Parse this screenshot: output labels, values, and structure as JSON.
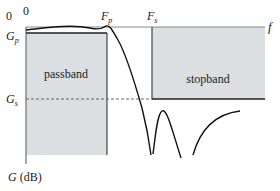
{
  "diagram": {
    "type": "lowpass-filter-specification",
    "axes": {
      "x_label": "f",
      "y_label": "G (dB)",
      "origin_x_label": "0",
      "origin_y_label": "0"
    },
    "frequency_markers": {
      "passband_edge": "F",
      "passband_edge_sub": "p",
      "stopband_edge": "F",
      "stopband_edge_sub": "s"
    },
    "gain_markers": {
      "passband_gain": "G",
      "passband_gain_sub": "p",
      "stopband_gain": "G",
      "stopband_gain_sub": "s"
    },
    "regions": {
      "passband_label": "passband",
      "stopband_label": "stopband"
    },
    "colors": {
      "region_fill": "#dcdfe2",
      "line": "#222222",
      "axis": "#888888",
      "dashed": "#666666"
    }
  }
}
